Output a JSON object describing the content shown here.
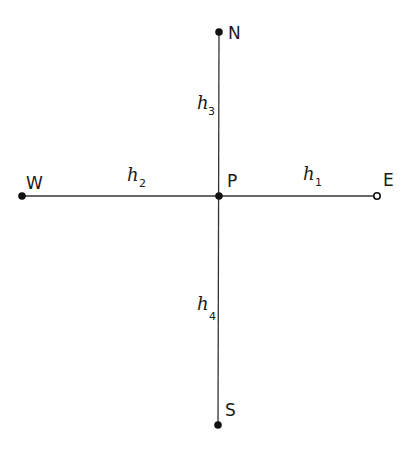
{
  "diagram": {
    "type": "compass-grid-points",
    "points": [
      {
        "id": "N",
        "label": "N"
      },
      {
        "id": "W",
        "label": "W"
      },
      {
        "id": "P",
        "label": "P"
      },
      {
        "id": "E",
        "label": "E"
      },
      {
        "id": "S",
        "label": "S"
      }
    ],
    "segments": [
      {
        "from": "P",
        "to": "E",
        "label": "h",
        "subscript": "1"
      },
      {
        "from": "W",
        "to": "P",
        "label": "h",
        "subscript": "2"
      },
      {
        "from": "N",
        "to": "P",
        "label": "h",
        "subscript": "3"
      },
      {
        "from": "P",
        "to": "S",
        "label": "h",
        "subscript": "4"
      }
    ]
  }
}
